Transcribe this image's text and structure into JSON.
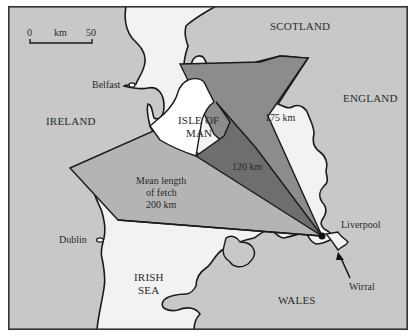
{
  "map": {
    "title": "Fetch lengths toward Liverpool / Wirral",
    "scale_bar": {
      "start": "0",
      "unit": "km",
      "end": "50"
    },
    "regions": {
      "scotland": "SCOTLAND",
      "england": "ENGLAND",
      "ireland": "IRELAND",
      "isle_of_man_line1": "ISLE OF",
      "isle_of_man_line2": "MAN",
      "irish_sea_line1": "IRISH",
      "irish_sea_line2": "SEA",
      "wales": "WALES"
    },
    "cities": {
      "belfast": "Belfast",
      "dublin": "Dublin",
      "liverpool": "Liverpool",
      "wirral": "Wirral"
    },
    "fetch": {
      "mean_line1": "Mean length",
      "mean_line2": "of fetch",
      "mean_value": "200 km",
      "inner": "120 km",
      "outer": "175 km"
    },
    "colors": {
      "land": "#c8c8c8",
      "sea": "#f2f2f2",
      "fetch_mean": "#b4b4b4",
      "fetch_175": "#8c8c8c",
      "fetch_120": "#6e6e6e",
      "outline": "#1a1a1a"
    }
  }
}
